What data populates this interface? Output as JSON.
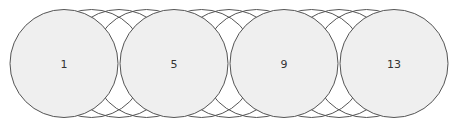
{
  "diagram": {
    "circle_count": 13,
    "labeled_circles": [
      {
        "index": 1,
        "label": "1"
      },
      {
        "index": 5,
        "label": "5"
      },
      {
        "index": 9,
        "label": "9"
      },
      {
        "index": 13,
        "label": "13"
      }
    ],
    "colors": {
      "stroke": "#555555",
      "fill": "#efefef",
      "background": "#ffffff",
      "label": "#333333"
    }
  }
}
